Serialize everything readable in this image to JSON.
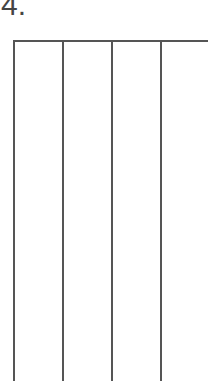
{
  "worksheet": {
    "item_number": "4.",
    "table": {
      "columns_visible": 4,
      "column_line_x": [
        13,
        62,
        111,
        160
      ],
      "line_color": "#555555",
      "top_border_y": 40
    }
  }
}
